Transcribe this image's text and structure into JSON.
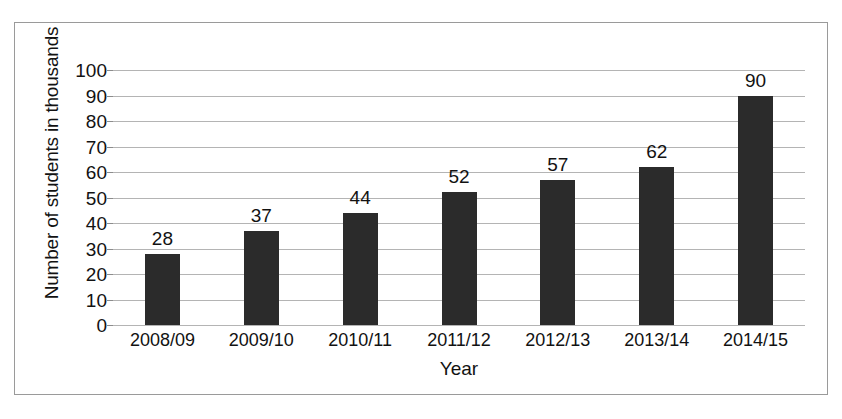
{
  "chart_data": {
    "type": "bar",
    "title": "",
    "subtitle": "",
    "xlabel": "Year",
    "ylabel": "Number of students in thousands",
    "categories": [
      "2008/09",
      "2009/10",
      "2010/11",
      "2011/12",
      "2012/13",
      "2013/14",
      "2014/15"
    ],
    "values": [
      28,
      37,
      44,
      52,
      57,
      62,
      90
    ],
    "data_labels": [
      "28",
      "37",
      "44",
      "52",
      "57",
      "62",
      "90"
    ],
    "ylim": [
      0,
      100
    ],
    "ytick_step": 10,
    "ytick_labels": [
      "100",
      "90",
      "80",
      "70",
      "60",
      "50",
      "40",
      "30",
      "20",
      "10",
      "0"
    ],
    "ytick_values": [
      100,
      90,
      80,
      70,
      60,
      50,
      40,
      30,
      20,
      10,
      0
    ],
    "grid": true,
    "grid_axis": "y",
    "legend": false,
    "legend_position": "none",
    "series": [
      {
        "name": "Number of students in thousands",
        "values": [
          28,
          37,
          44,
          52,
          57,
          62,
          90
        ],
        "color": "#2b2b2b"
      }
    ],
    "colors": {
      "bar": "#2b2b2b",
      "gridline": "#b4b4b4",
      "frame": "#9a9a9a",
      "text": "#121212",
      "background": "#ffffff"
    }
  }
}
